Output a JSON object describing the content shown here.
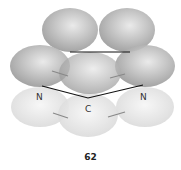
{
  "diagram": {
    "atom_labels": {
      "left_n": "N",
      "right_n": "N",
      "center_c": "C"
    },
    "caption": "62",
    "colors": {
      "upper_lobe": "#9a9a9a",
      "lower_lobe": "#dcdcdc",
      "bond": "#111111",
      "arrow": "#888888"
    }
  }
}
